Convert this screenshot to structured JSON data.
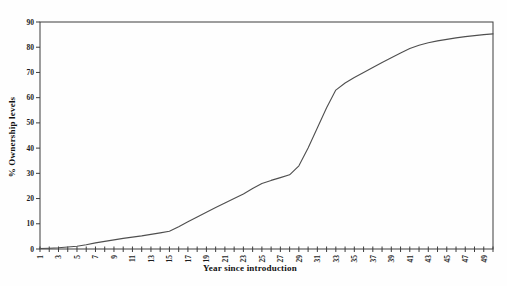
{
  "page": {
    "background": "#ffffff"
  },
  "chart_data": {
    "type": "line",
    "title": "",
    "xlabel": "Year since introduction",
    "ylabel": "% Ownership levels",
    "xlim": [
      1,
      50
    ],
    "ylim": [
      0,
      90
    ],
    "yticks": [
      0,
      10,
      20,
      30,
      40,
      50,
      60,
      70,
      80,
      90
    ],
    "xtick_labels": [
      1,
      3,
      5,
      7,
      9,
      11,
      13,
      15,
      17,
      19,
      21,
      23,
      25,
      27,
      29,
      31,
      33,
      35,
      37,
      39,
      41,
      43,
      45,
      47,
      49
    ],
    "x_minor_tick_step": 1,
    "grid": false,
    "frame": true,
    "legend": null,
    "line_color": "#4f4f4f",
    "frame_color": "#3d3d3d",
    "tick_color": "#3d3d3d",
    "text_color": "#1c1c1c",
    "series": [
      {
        "name": "% Ownership levels",
        "x": [
          1,
          2,
          3,
          4,
          5,
          6,
          7,
          8,
          9,
          10,
          11,
          12,
          13,
          14,
          15,
          16,
          17,
          18,
          19,
          20,
          21,
          22,
          23,
          24,
          25,
          26,
          27,
          28,
          29,
          30,
          31,
          32,
          33,
          34,
          35,
          36,
          37,
          38,
          39,
          40,
          41,
          42,
          43,
          44,
          45,
          46,
          47,
          48,
          49,
          50
        ],
        "y": [
          0.2,
          0.3,
          0.5,
          0.8,
          1.1,
          1.7,
          2.4,
          3.0,
          3.6,
          4.2,
          4.7,
          5.2,
          5.8,
          6.4,
          7.0,
          8.8,
          10.8,
          12.7,
          14.6,
          16.4,
          18.2,
          20.0,
          21.8,
          24.0,
          26.0,
          27.2,
          28.3,
          29.4,
          33.0,
          40.0,
          48.0,
          56.0,
          63.0,
          65.8,
          68.0,
          70.0,
          72.0,
          74.0,
          75.8,
          77.7,
          79.5,
          80.8,
          81.8,
          82.5,
          83.1,
          83.7,
          84.2,
          84.6,
          85.0,
          85.3
        ]
      }
    ]
  }
}
